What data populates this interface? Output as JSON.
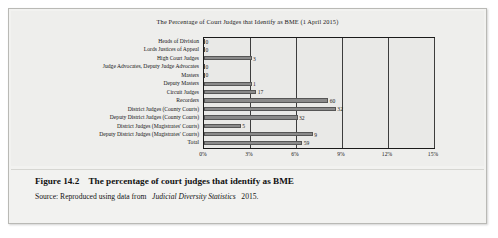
{
  "figure": {
    "number": "Figure 14.2",
    "caption": "The percentage of court judges that identify as BME",
    "source_prefix": "Source: Reproduced using data from",
    "source_italic": "Judicial Diversity Statistics",
    "source_suffix": "2015."
  },
  "chart_data": {
    "type": "bar",
    "orientation": "horizontal",
    "title": "The Percentage of Court Judges that Identify as BME (1 April 2015)",
    "xlabel": "",
    "ylabel": "",
    "xlim": [
      0,
      15
    ],
    "xticks": [
      "0%",
      "3%",
      "6%",
      "9%",
      "12%",
      "15%"
    ],
    "xtick_values": [
      0,
      3,
      6,
      9,
      12,
      15
    ],
    "grid": true,
    "legend": false,
    "categories": [
      "Heads of Division",
      "Lords Justices of Appeal",
      "High Court Judges",
      "Judge Advocates, Deputy Judge Advocates",
      "Masters",
      "Deputy Masters",
      "Circuit Judges",
      "Recorders",
      "District Judges (County Courts)",
      "Deputy District Judges (County Courts)",
      "District Judges (Magistrates' Courts)",
      "Deputy District Judges (Magistrates' Courts)",
      "Total"
    ],
    "data_labels": [
      "0",
      "0",
      "3",
      "0",
      "0",
      "1",
      "17",
      "60",
      "32",
      "32",
      "5",
      "9",
      "59"
    ],
    "values": [
      0,
      0,
      3.1,
      0,
      0,
      3.1,
      3.4,
      8.1,
      8.6,
      6.1,
      2.4,
      7.1,
      6.4
    ],
    "bar_color": "#8a8a8a",
    "plot_background": "#e9e9e7",
    "axis_color": "#1a1a1a"
  }
}
